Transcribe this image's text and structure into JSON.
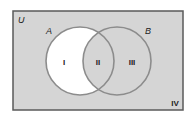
{
  "diagram": {
    "type": "venn",
    "universe": {
      "label": "U",
      "fill": "#d5d5d5",
      "stroke": "#5a5a5a"
    },
    "sets": [
      {
        "label": "A",
        "cx": 80,
        "cy": 61,
        "r": 34,
        "stroke": "#8c8c8c"
      },
      {
        "label": "B",
        "cx": 117,
        "cy": 61,
        "r": 34,
        "stroke": "#8c8c8c"
      }
    ],
    "regions": [
      {
        "label": "I",
        "description": "A only",
        "fill": "#ffffff"
      },
      {
        "label": "II",
        "description": "A and B",
        "fill": "#d5d5d5"
      },
      {
        "label": "III",
        "description": "B only",
        "fill": "#d5d5d5"
      },
      {
        "label": "IV",
        "description": "outside A and B",
        "fill": "#d5d5d5"
      }
    ]
  }
}
